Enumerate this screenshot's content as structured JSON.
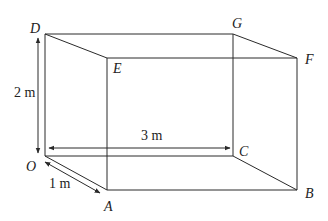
{
  "figure": {
    "type": "cuboid",
    "vertices": {
      "O": {
        "label": "O",
        "x": 45,
        "y": 156
      },
      "A": {
        "label": "A",
        "x": 107,
        "y": 190
      },
      "B": {
        "label": "B",
        "x": 297,
        "y": 190
      },
      "C": {
        "label": "C",
        "x": 233,
        "y": 156
      },
      "D": {
        "label": "D",
        "x": 45,
        "y": 34
      },
      "E": {
        "label": "E",
        "x": 107,
        "y": 58
      },
      "F": {
        "label": "F",
        "x": 297,
        "y": 58
      },
      "G": {
        "label": "G",
        "x": 233,
        "y": 34
      }
    },
    "dimensions": {
      "height": {
        "label": "2 m",
        "between": [
          "O",
          "D"
        ]
      },
      "length": {
        "label": "3 m",
        "between": [
          "O",
          "C"
        ]
      },
      "width": {
        "label": "1 m",
        "between": [
          "O",
          "A"
        ]
      }
    },
    "colors": {
      "line": "#2a2a2a",
      "text": "#222222",
      "background": "#ffffff"
    }
  }
}
